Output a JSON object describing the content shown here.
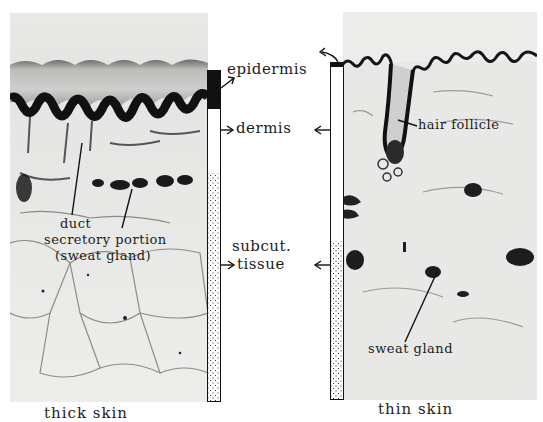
{
  "figure": {
    "panels": [
      {
        "id": "thick",
        "caption": "thick skin",
        "annotations": {
          "duct": "duct",
          "secretory": "secretory portion",
          "sweat_gland": "(sweat gland)"
        }
      },
      {
        "id": "thin",
        "caption": "thin skin",
        "annotations": {
          "hair_follicle": "hair follicle",
          "sweat_gland": "sweat gland"
        }
      }
    ],
    "layer_labels": {
      "epidermis": "epidermis",
      "dermis": "dermis",
      "subcut_line1": "subcut.",
      "subcut_line2": "tissue"
    },
    "legend_patterns": {
      "epidermis": "solid black",
      "dermis": "white",
      "subcutaneous": "stippled"
    },
    "colors": {
      "ink": "#111111",
      "tissue_bg": "#e6e6e4",
      "paper": "#ffffff"
    }
  }
}
